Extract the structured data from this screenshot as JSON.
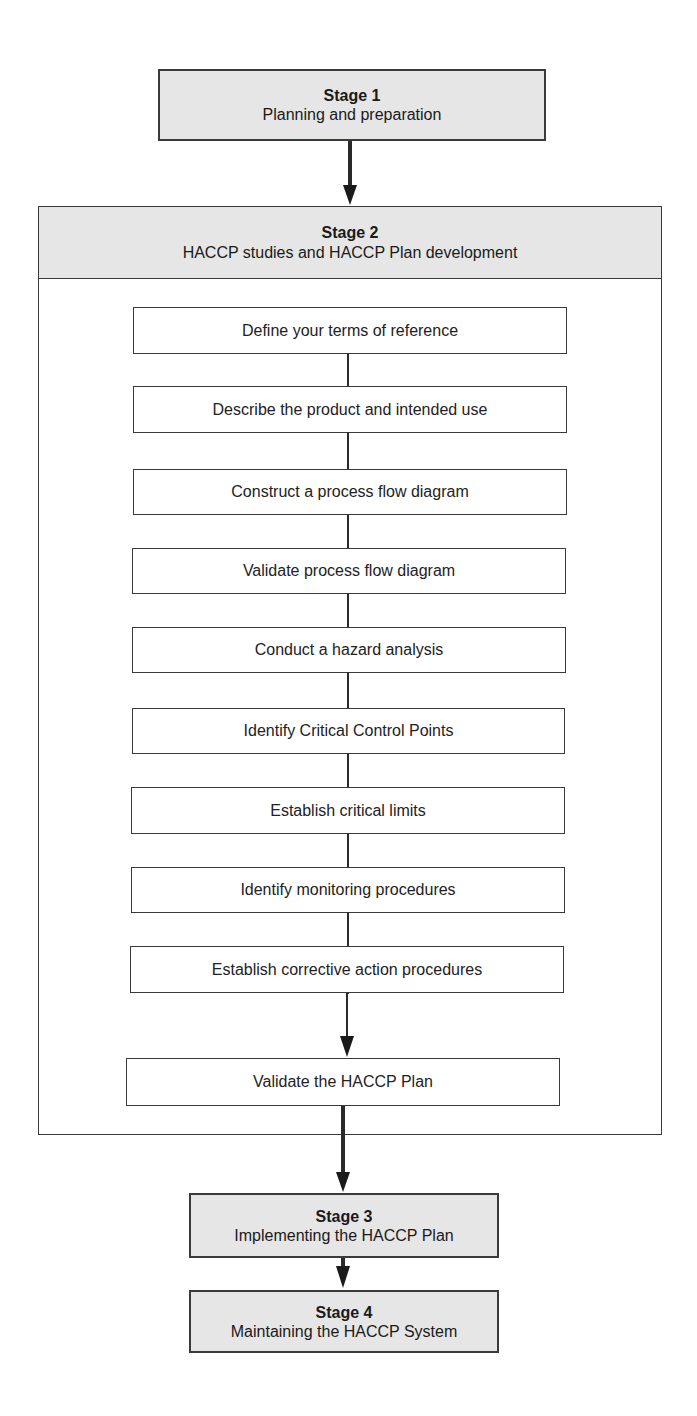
{
  "stage1": {
    "title": "Stage 1",
    "subtitle": "Planning and preparation"
  },
  "stage2": {
    "title": "Stage 2",
    "subtitle": "HACCP studies and HACCP Plan development",
    "steps": [
      "Define your terms of reference",
      "Describe the product and intended use",
      "Construct a process flow diagram",
      "Validate process flow diagram",
      "Conduct a hazard analysis",
      "Identify Critical Control Points",
      "Establish critical limits",
      "Identify monitoring procedures",
      "Establish corrective action procedures"
    ],
    "final_step": "Validate the HACCP Plan"
  },
  "stage3": {
    "title": "Stage 3",
    "subtitle": "Implementing the HACCP Plan"
  },
  "stage4": {
    "title": "Stage 4",
    "subtitle": "Maintaining the HACCP System"
  },
  "colors": {
    "stage_fill": "#e6e6e6",
    "border": "#3a3a3a",
    "background": "#ffffff"
  }
}
